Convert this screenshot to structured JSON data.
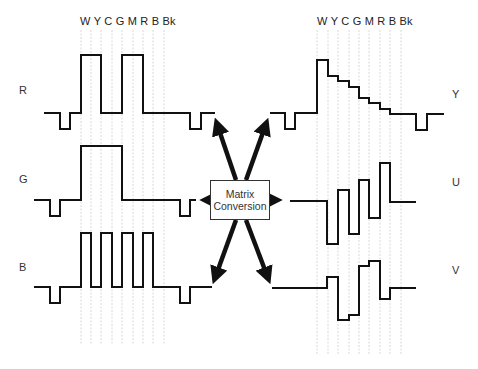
{
  "diagram": {
    "bar_header_left": "W Y C G M R B Bk",
    "bar_header_right": "W Y C G M R B Bk",
    "color_bars": [
      "W",
      "Y",
      "C",
      "G",
      "M",
      "R",
      "B",
      "Bk"
    ],
    "inputs": [
      {
        "label": "R"
      },
      {
        "label": "G"
      },
      {
        "label": "B"
      }
    ],
    "outputs": [
      {
        "label": "Y"
      },
      {
        "label": "U"
      },
      {
        "label": "V"
      }
    ],
    "converter": {
      "line1": "Matrix",
      "line2": "Conversion"
    },
    "colors": {
      "stroke": "#111111",
      "grid": "#cccccc",
      "text": "#333333",
      "background": "#ffffff"
    }
  }
}
